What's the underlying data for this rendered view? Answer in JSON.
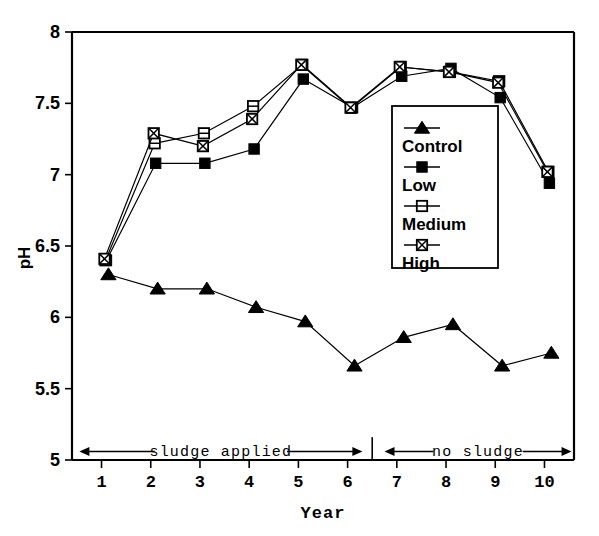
{
  "chart_data": {
    "type": "line",
    "title": "",
    "xlabel": "Year",
    "ylabel": "pH",
    "x": [
      1,
      2,
      3,
      4,
      5,
      6,
      7,
      8,
      9,
      10
    ],
    "xlim": [
      0.4,
      10.6
    ],
    "ylim": [
      5,
      8
    ],
    "xticks": [
      "1",
      "2",
      "3",
      "4",
      "5",
      "6",
      "7",
      "8",
      "9",
      "10"
    ],
    "yticks": [
      "5",
      "5.5",
      "6",
      "6.5",
      "7",
      "7.5",
      "8"
    ],
    "ytick_values": [
      5,
      5.5,
      6,
      6.5,
      7,
      7.5,
      8
    ],
    "grid": false,
    "legend_position": "center-right",
    "series": [
      {
        "name": "Control",
        "marker": "filled-triangle",
        "values": [
          6.3,
          6.2,
          6.2,
          6.07,
          5.97,
          5.66,
          5.86,
          5.95,
          5.66,
          5.75
        ],
        "x_offset": 0.14
      },
      {
        "name": "Low",
        "marker": "filled-square",
        "values": [
          6.4,
          7.08,
          7.08,
          7.18,
          7.67,
          7.47,
          7.69,
          7.745,
          7.54,
          6.94
        ],
        "x_offset": 0.1
      },
      {
        "name": "Medium",
        "marker": "open-square",
        "values": [
          6.4,
          7.22,
          7.29,
          7.48,
          7.77,
          7.47,
          7.755,
          7.72,
          7.655,
          7.02
        ],
        "x_offset": 0.08
      },
      {
        "name": "High",
        "marker": "crossed-square",
        "values": [
          6.41,
          7.29,
          7.2,
          7.39,
          7.77,
          7.47,
          7.755,
          7.72,
          7.645,
          7.02
        ],
        "x_offset": 0.06
      }
    ],
    "annotations": [
      {
        "text": "sludge applied",
        "x_start": 0.55,
        "x_end": 6.3,
        "y": 5.06
      },
      {
        "text": "no sludge",
        "x_start": 6.75,
        "x_end": 10.55,
        "y": 5.06
      }
    ],
    "separator_x": 6.5
  },
  "legend": {
    "entries": [
      {
        "label": "Control",
        "marker": "filled-triangle"
      },
      {
        "label": "Low",
        "marker": "filled-square"
      },
      {
        "label": "Medium",
        "marker": "open-square"
      },
      {
        "label": "High",
        "marker": "crossed-square"
      }
    ]
  },
  "colors": {
    "ink": "#000000",
    "background": "#ffffff"
  }
}
